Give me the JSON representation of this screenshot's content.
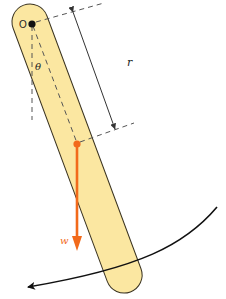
{
  "diagram": {
    "labels": {
      "pivot": "O",
      "angle": "θ",
      "distance": "r",
      "weight": "w"
    },
    "colors": {
      "rod_fill": "#fbe7a1",
      "rod_stroke": "#3a3320",
      "weight_arrow": "#f26a1b",
      "dashed": "#555555",
      "dimension": "#333333",
      "arc": "#111111",
      "pivot_dot": "#111111"
    },
    "elements": [
      {
        "id": "rod",
        "type": "capsule",
        "description": "elongated rigid body pivoting about point O"
      },
      {
        "id": "pivot",
        "type": "point",
        "label": "O"
      },
      {
        "id": "center_of_mass",
        "type": "point",
        "color": "orange"
      },
      {
        "id": "vertical_reference",
        "type": "dashed-line",
        "from": "O",
        "direction": "down"
      },
      {
        "id": "om_line",
        "type": "dashed-line",
        "from": "O",
        "to": "center_of_mass"
      },
      {
        "id": "angle",
        "type": "angle-label",
        "label": "θ",
        "between": [
          "vertical_reference",
          "om_line"
        ]
      },
      {
        "id": "r_dimension",
        "type": "dimension-arrow",
        "label": "r",
        "from": "O",
        "to": "center_of_mass"
      },
      {
        "id": "weight",
        "type": "force-arrow",
        "label": "w",
        "direction": "down",
        "from": "center_of_mass"
      },
      {
        "id": "rotation_arc",
        "type": "curved-arrow",
        "direction": "counter-clockwise (leftward swing)"
      }
    ]
  }
}
